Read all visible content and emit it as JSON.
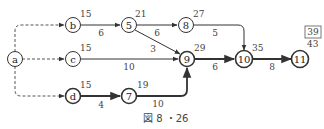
{
  "diagram": {
    "caption": "図 8 ・26",
    "box_value": "39",
    "nodes": {
      "a": {
        "label": "a",
        "time": ""
      },
      "b": {
        "label": "b",
        "time": "15"
      },
      "c": {
        "label": "c",
        "time": "15"
      },
      "d": {
        "label": "d",
        "time": "15"
      },
      "n5": {
        "label": "5",
        "time": "21"
      },
      "n7": {
        "label": "7",
        "time": "19"
      },
      "n8": {
        "label": "8",
        "time": "27"
      },
      "n9": {
        "label": "9",
        "time": "29"
      },
      "n10": {
        "label": "10",
        "time": "35"
      },
      "n11": {
        "label": "11",
        "time": "43"
      }
    },
    "edges": {
      "a_b": {
        "from": "a",
        "to": "b",
        "weight": "",
        "style": "dashed"
      },
      "a_c": {
        "from": "a",
        "to": "c",
        "weight": "",
        "style": "dashed"
      },
      "a_d": {
        "from": "a",
        "to": "d",
        "weight": "",
        "style": "dashed"
      },
      "b_5": {
        "from": "b",
        "to": "5",
        "weight": "6",
        "style": "solid"
      },
      "n5_8": {
        "from": "5",
        "to": "8",
        "weight": "6",
        "style": "solid"
      },
      "n5_9": {
        "from": "5",
        "to": "9",
        "weight": "3",
        "style": "solid"
      },
      "c_9": {
        "from": "c",
        "to": "9",
        "weight": "10",
        "style": "solid"
      },
      "d_7": {
        "from": "d",
        "to": "7",
        "weight": "4",
        "style": "bold"
      },
      "n7_9": {
        "from": "7",
        "to": "9",
        "weight": "10",
        "style": "bold"
      },
      "n8_10": {
        "from": "8",
        "to": "10",
        "weight": "5",
        "style": "solid"
      },
      "n9_10": {
        "from": "9",
        "to": "10",
        "weight": "6",
        "style": "bold"
      },
      "n10_11": {
        "from": "10",
        "to": "11",
        "weight": "8",
        "style": "bold"
      }
    }
  }
}
